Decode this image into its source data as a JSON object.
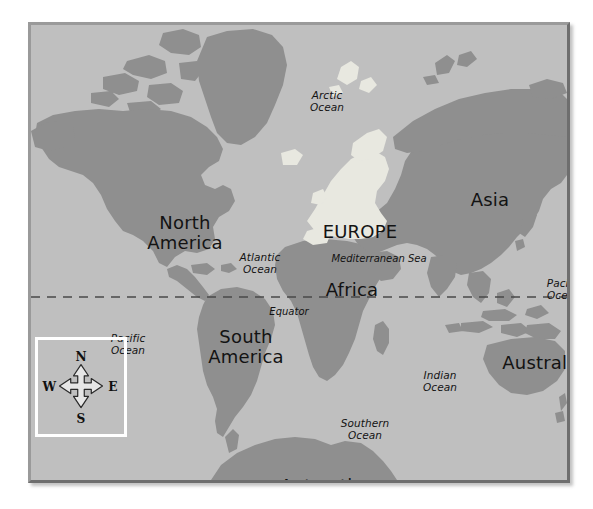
{
  "figure": {
    "kind": "world-map",
    "projection_note": "equirectangular world map with equator line and compass inset"
  },
  "colors": {
    "page_background": "#ffffff",
    "ocean": "#bfbfbf",
    "land": "#8f8f8f",
    "land_highlight_europe": "#e8e8e0",
    "frame_light": "#9a9a9a",
    "frame_dark": "#6e6e6e",
    "label_text": "#131313",
    "equator_line": "#4a4a4a",
    "compass_border": "#ffffff",
    "compass_fill": "#e6e6e6",
    "compass_outline": "#2a2a2a"
  },
  "continents": [
    {
      "id": "north-america",
      "label": "North\nAmerica",
      "x": 154,
      "y": 208,
      "size": "large"
    },
    {
      "id": "south-america",
      "label": "South\nAmerica",
      "x": 215,
      "y": 322,
      "size": "large"
    },
    {
      "id": "europe",
      "label": "EUROPE",
      "x": 329,
      "y": 207,
      "size": "large"
    },
    {
      "id": "africa",
      "label": "Africa",
      "x": 321,
      "y": 265,
      "size": "large"
    },
    {
      "id": "asia",
      "label": "Asia",
      "x": 459,
      "y": 175,
      "size": "large"
    },
    {
      "id": "australia",
      "label": "Australia",
      "x": 512,
      "y": 338,
      "size": "large"
    },
    {
      "id": "antarctica",
      "label": "Antarctica",
      "x": 296,
      "y": 461,
      "size": "large"
    }
  ],
  "oceans": [
    {
      "id": "arctic-ocean",
      "label": "Arctic\nOcean",
      "x": 296,
      "y": 77
    },
    {
      "id": "atlantic-ocean",
      "label": "Atlantic\nOcean",
      "x": 229,
      "y": 239
    },
    {
      "id": "pacific-ocean-east",
      "label": "Pacific\nOcean",
      "x": 533,
      "y": 265
    },
    {
      "id": "pacific-ocean-west",
      "label": "Pacific\nOcean",
      "x": 97,
      "y": 320
    },
    {
      "id": "indian-ocean",
      "label": "Indian\nOcean",
      "x": 409,
      "y": 357
    },
    {
      "id": "southern-ocean",
      "label": "Southern\nOcean",
      "x": 334,
      "y": 405
    }
  ],
  "seas": [
    {
      "id": "mediterranean-sea",
      "label": "Mediterranean Sea",
      "x": 348,
      "y": 234
    }
  ],
  "reference_lines": [
    {
      "id": "equator",
      "label": "Equator",
      "label_x": 258,
      "label_y": 287,
      "line_y": 293,
      "style": "dashed"
    }
  ],
  "compass": {
    "north": "N",
    "west": "W",
    "east": "E",
    "south": "S"
  }
}
